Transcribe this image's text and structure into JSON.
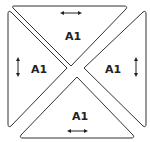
{
  "diagram": {
    "pieces": [
      {
        "id": "top",
        "label": "A1",
        "grain": "horizontal"
      },
      {
        "id": "left",
        "label": "A1",
        "grain": "vertical"
      },
      {
        "id": "right",
        "label": "A1",
        "grain": "vertical"
      },
      {
        "id": "bottom",
        "label": "A1",
        "grain": "horizontal"
      }
    ],
    "colors": {
      "stroke": "#333333",
      "fill": "#ffffff"
    }
  }
}
